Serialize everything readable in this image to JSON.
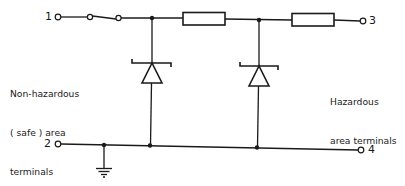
{
  "diagram": {
    "type": "circuit-schematic",
    "terminals": {
      "t1": "1",
      "t2": "2",
      "t3": "3",
      "t4": "4"
    },
    "labels": {
      "safe_area": {
        "line1": "Non-hazardous",
        "line2": "( safe ) area",
        "line3": "terminals"
      },
      "hazardous_area": {
        "line1": "Hazardous",
        "line2": "area terminals"
      }
    },
    "components": [
      {
        "id": "switch",
        "kind": "switch",
        "between": [
          "1",
          "node-a"
        ]
      },
      {
        "id": "resistor-1",
        "kind": "resistor",
        "between": [
          "node-a",
          "node-b"
        ]
      },
      {
        "id": "resistor-2",
        "kind": "resistor",
        "between": [
          "node-b",
          "3"
        ]
      },
      {
        "id": "zener-1",
        "kind": "zener-diode",
        "between": [
          "node-a",
          "rail-2-4"
        ]
      },
      {
        "id": "zener-2",
        "kind": "zener-diode",
        "between": [
          "node-b",
          "rail-2-4"
        ]
      },
      {
        "id": "ground",
        "kind": "earth",
        "connected_to": "rail-2-4"
      }
    ],
    "colors": {
      "ink": "#1a1a1a",
      "background": "#ffffff"
    }
  }
}
